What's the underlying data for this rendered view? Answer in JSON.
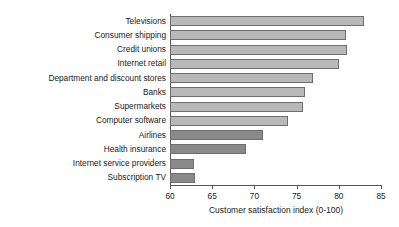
{
  "chart_data": {
    "type": "bar",
    "orientation": "horizontal",
    "title": "",
    "subtitle": "",
    "xlabel": "Customer satisfaction index (0-100)",
    "ylabel": "",
    "xlim": [
      60,
      85
    ],
    "xticks": [
      60,
      65,
      70,
      75,
      80,
      85
    ],
    "xtick_labels": [
      "60",
      "65",
      "70",
      "75",
      "80",
      "85"
    ],
    "grid": false,
    "legend": null,
    "categories": [
      "Televisions",
      "Consumer shipping",
      "Credit unions",
      "Internet retail",
      "Department and discount stores",
      "Banks",
      "Supermarkets",
      "Computer software",
      "Airlines",
      "Health insurance",
      "Internet service providers",
      "Subscription TV"
    ],
    "values": [
      83,
      80.8,
      81,
      80,
      77,
      76,
      75.8,
      74,
      71,
      69,
      62.9,
      63
    ],
    "bar_styles": [
      "light",
      "light",
      "light",
      "light",
      "light",
      "light",
      "light",
      "light",
      "dark",
      "dark",
      "dark",
      "dark"
    ],
    "colors": {
      "light_bar_fill": "#b9b9b9",
      "dark_bar_fill": "#8a8a8a",
      "bar_stroke": "#6e6e6e",
      "axis": "#555555",
      "text": "#1a1a1a",
      "background": "#ffffff"
    }
  }
}
